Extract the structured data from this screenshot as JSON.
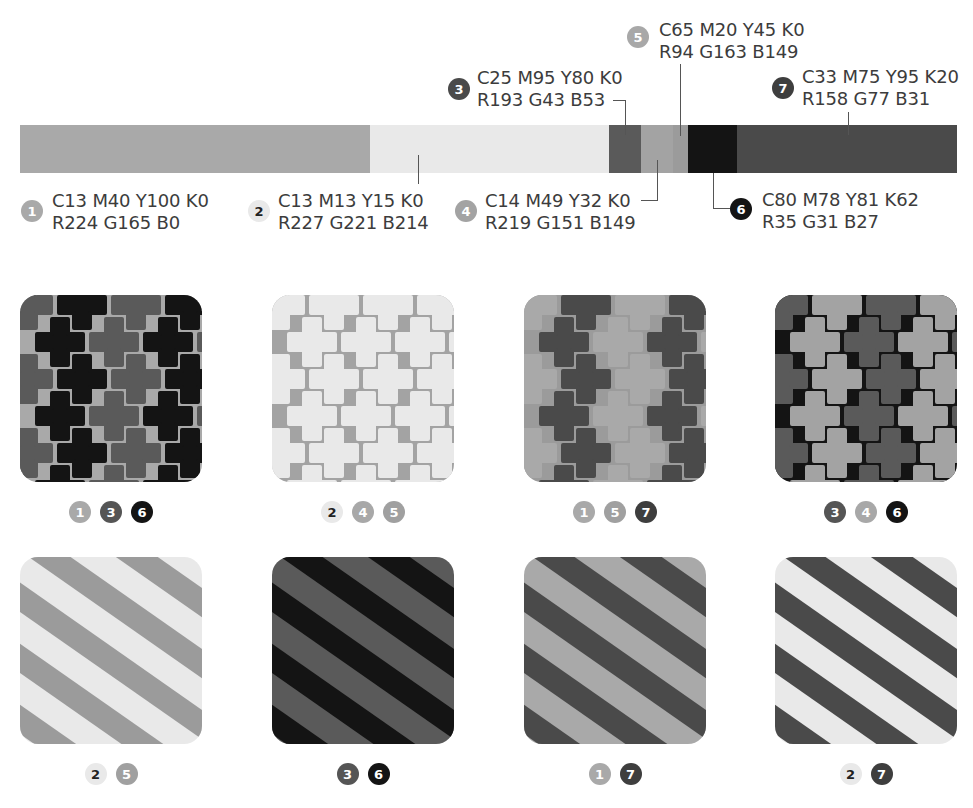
{
  "palette": [
    {
      "id": "1",
      "cmyk": "C13 M40 Y100 K0",
      "rgb": "R224 G165 B0",
      "gray": "#a9a9a9",
      "text_color": "#ffffff",
      "width": 589
    },
    {
      "id": "2",
      "cmyk": "C13 M13 Y15 K0",
      "rgb": "R227 G221 B214",
      "gray": "#e9e9e9",
      "text_color": "#222222",
      "width": 0
    },
    {
      "id": "3",
      "cmyk": "C25 M95 Y80 K0",
      "rgb": "R193 G43 B53",
      "gray": "#5a5a5a",
      "text_color": "#ffffff",
      "width": 32
    },
    {
      "id": "4",
      "cmyk": "C14 M49 Y32 K0",
      "rgb": "R219 G151 B149",
      "gray": "#a3a3a3",
      "text_color": "#ffffff",
      "width": 32
    },
    {
      "id": "5",
      "cmyk": "C65 M20 Y45 K0",
      "rgb": "R94 G163 B149",
      "gray": "#9b9b9b",
      "text_color": "#ffffff",
      "width": 15
    },
    {
      "id": "6",
      "cmyk": "C80 M78 Y81 K62",
      "rgb": "R35 G31 B27",
      "gray": "#141414",
      "text_color": "#ffffff",
      "width": 49
    },
    {
      "id": "7",
      "cmyk": "C33 M75 Y95 K20",
      "rgb": "R158 G77 B31",
      "gray": "#4a4a4a",
      "text_color": "#ffffff",
      "width": 220
    }
  ],
  "bar_segments": [
    {
      "id": "1",
      "width": 350
    },
    {
      "id": "2",
      "width": 239
    },
    {
      "id": "3",
      "width": 32
    },
    {
      "id": "4",
      "width": 32
    },
    {
      "id": "5",
      "width": 15
    },
    {
      "id": "6",
      "width": 49
    },
    {
      "id": "7",
      "width": 220
    }
  ],
  "labels": {
    "l1": {
      "num": "1",
      "line1": "C13 M40 Y100 K0",
      "line2": "R224 G165 B0"
    },
    "l2": {
      "num": "2",
      "line1": "C13 M13 Y15 K0",
      "line2": "R227 G221 B214"
    },
    "l3": {
      "num": "3",
      "line1": "C25 M95 Y80 K0",
      "line2": "R193 G43 B53"
    },
    "l4": {
      "num": "4",
      "line1": "C14 M49 Y32 K0",
      "line2": "R219 G151 B149"
    },
    "l5": {
      "num": "5",
      "line1": "C65 M20 Y45 K0",
      "line2": "R94 G163 B149"
    },
    "l6": {
      "num": "6",
      "line1": "C80 M78 Y81 K62",
      "line2": "R35 G31 B27"
    },
    "l7": {
      "num": "7",
      "line1": "C33 M75 Y95 K20",
      "line2": "R158 G77 B31"
    }
  },
  "tiles": [
    {
      "pattern": "cross",
      "bg": "1",
      "motifs": [
        "3",
        "6"
      ],
      "badges": [
        "1",
        "3",
        "6"
      ]
    },
    {
      "pattern": "cross",
      "bg": "4",
      "motifs": [
        "2",
        "2"
      ],
      "badges": [
        "2",
        "4",
        "5"
      ]
    },
    {
      "pattern": "cross",
      "bg": "5",
      "motifs": [
        "1",
        "7"
      ],
      "badges": [
        "1",
        "5",
        "7"
      ]
    },
    {
      "pattern": "cross",
      "bg": "6",
      "motifs": [
        "3",
        "4"
      ],
      "badges": [
        "3",
        "4",
        "6"
      ]
    },
    {
      "pattern": "stripe",
      "bg": "2",
      "motifs": [
        "5"
      ],
      "badges": [
        "2",
        "5"
      ]
    },
    {
      "pattern": "stripe",
      "bg": "3",
      "motifs": [
        "6"
      ],
      "badges": [
        "3",
        "6"
      ]
    },
    {
      "pattern": "stripe",
      "bg": "1",
      "motifs": [
        "7"
      ],
      "badges": [
        "1",
        "7"
      ]
    },
    {
      "pattern": "stripe",
      "bg": "2",
      "motifs": [
        "7"
      ],
      "badges": [
        "2",
        "7"
      ]
    }
  ]
}
